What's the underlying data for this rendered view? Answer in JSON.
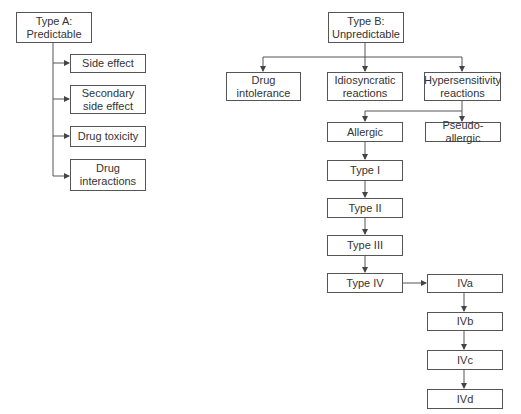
{
  "diagram": {
    "type_a": {
      "title": "Type A:\nPredictable",
      "title_line1": "Type A:",
      "title_line2": "Predictable",
      "children": [
        {
          "line1": "Side effect",
          "line2": ""
        },
        {
          "line1": "Secondary",
          "line2": "side effect"
        },
        {
          "line1": "Drug toxicity",
          "line2": ""
        },
        {
          "line1": "Drug",
          "line2": "interactions"
        }
      ]
    },
    "type_b": {
      "title_line1": "Type B:",
      "title_line2": "Unpredictable",
      "children": [
        {
          "line1": "Drug",
          "line2": "intolerance"
        },
        {
          "line1": "Idiosyncratic",
          "line2": "reactions"
        },
        {
          "line1": "Hypersensitivity",
          "line2": "reactions"
        }
      ],
      "hypersensitivity_children": [
        "Allergic",
        "Pseudo-allergic"
      ],
      "allergic_chain": [
        "Type I",
        "Type II",
        "Type III",
        "Type IV"
      ],
      "type_iv_chain": [
        "IVa",
        "IVb",
        "IVc",
        "IVd"
      ]
    },
    "colors": {
      "line": "#555555",
      "text": "#333333",
      "background": "#ffffff"
    }
  }
}
